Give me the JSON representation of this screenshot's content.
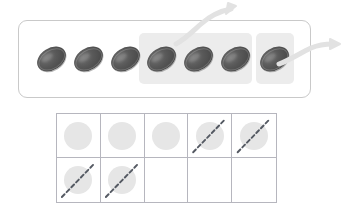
{
  "diagram": {
    "colors": {
      "counter_dark": "#4a4a4a",
      "counter_light": "#6e6e6e",
      "group_highlight": "#ececec",
      "panel_border": "#c9c9c9",
      "frame_border": "#b6b6be",
      "dot_fill": "#e6e6e6",
      "cross_stroke": "#555a63",
      "arrow_stroke": "#e0e0e0",
      "background": "#ffffff"
    }
  },
  "counter_panel": {
    "name": "counter-row-panel",
    "total_counters": 7,
    "counters": [
      {
        "index": 1,
        "x": 36,
        "grouped": false,
        "group": null
      },
      {
        "index": 2,
        "x": 73,
        "grouped": false,
        "group": null
      },
      {
        "index": 3,
        "x": 110,
        "grouped": false,
        "group": null
      },
      {
        "index": 4,
        "x": 146,
        "grouped": true,
        "group": 1
      },
      {
        "index": 5,
        "x": 183,
        "grouped": true,
        "group": 1
      },
      {
        "index": 6,
        "x": 220,
        "grouped": true,
        "group": 1
      },
      {
        "index": 7,
        "x": 259,
        "grouped": true,
        "group": 2
      }
    ],
    "groups": [
      {
        "id": 1,
        "label": "group-of-three",
        "count": 3,
        "x": 139,
        "y": 33,
        "width": 113,
        "height": 51
      },
      {
        "id": 2,
        "label": "group-of-one",
        "count": 1,
        "x": 256,
        "y": 33,
        "width": 38,
        "height": 51
      }
    ],
    "arrows": [
      {
        "id": 1,
        "label": "remove-group-of-three-arrow",
        "direction": "up-right",
        "from_x": 175,
        "from_y": 40,
        "to_x": 234,
        "to_y": 8
      },
      {
        "id": 2,
        "label": "remove-group-of-one-arrow",
        "direction": "right",
        "from_x": 278,
        "from_y": 62,
        "to_x": 338,
        "to_y": 44
      }
    ]
  },
  "ten_frame": {
    "name": "ten-frame",
    "rows": 2,
    "columns": 5,
    "total_cells": 10,
    "dots_filled": 7,
    "dots_crossed_out": 4,
    "dots_remaining": 3,
    "cells": [
      {
        "index": 1,
        "row": 1,
        "col": 1,
        "has_dot": true,
        "crossed": false
      },
      {
        "index": 2,
        "row": 1,
        "col": 2,
        "has_dot": true,
        "crossed": false
      },
      {
        "index": 3,
        "row": 1,
        "col": 3,
        "has_dot": true,
        "crossed": false
      },
      {
        "index": 4,
        "row": 1,
        "col": 4,
        "has_dot": true,
        "crossed": true
      },
      {
        "index": 5,
        "row": 1,
        "col": 5,
        "has_dot": true,
        "crossed": true
      },
      {
        "index": 6,
        "row": 2,
        "col": 1,
        "has_dot": true,
        "crossed": true
      },
      {
        "index": 7,
        "row": 2,
        "col": 2,
        "has_dot": true,
        "crossed": true
      },
      {
        "index": 8,
        "row": 2,
        "col": 3,
        "has_dot": false,
        "crossed": false
      },
      {
        "index": 9,
        "row": 2,
        "col": 4,
        "has_dot": false,
        "crossed": false
      },
      {
        "index": 10,
        "row": 2,
        "col": 5,
        "has_dot": false,
        "crossed": false
      }
    ]
  }
}
